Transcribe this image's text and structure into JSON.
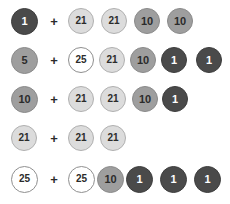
{
  "canvas": {
    "width": 230,
    "height": 204,
    "background": "#ffffff"
  },
  "legend": {
    "operator": "+",
    "token_colors": {
      "1": "#4a4a4a",
      "5": "#9e9e9e",
      "10": "#9e9e9e",
      "21": "#dcdcdc",
      "25": "#ffffff"
    },
    "border_colors": {
      "1": "#3d3d3d",
      "5": "#8a8a8a",
      "10": "#8a8a8a",
      "21": "#b0b0b0",
      "25": "#8f8f8f"
    },
    "text_colors": {
      "1": "#ffffff",
      "5": "#2b2b2b",
      "10": "#2b2b2b",
      "21": "#2b2b2b",
      "25": "#2b2b2b"
    }
  },
  "rows": [
    {
      "name": "row-1",
      "items": [
        {
          "kind": "token",
          "value": "1",
          "size": 27,
          "left": 11,
          "gap_after": 11
        },
        {
          "kind": "plus",
          "value": "+",
          "size": 10,
          "left": 49,
          "gap_after": 9
        },
        {
          "kind": "token",
          "value": "21",
          "size": 26,
          "left": 68,
          "gap_after": 7
        },
        {
          "kind": "token",
          "value": "21",
          "size": 26,
          "left": 101,
          "gap_after": 7
        },
        {
          "kind": "token",
          "value": "10",
          "size": 26,
          "left": 134,
          "gap_after": 7
        },
        {
          "kind": "token",
          "value": "10",
          "size": 26,
          "left": 167,
          "gap_after": 0
        }
      ]
    },
    {
      "name": "row-2",
      "items": [
        {
          "kind": "token",
          "value": "5",
          "size": 27,
          "left": 11,
          "gap_after": 11
        },
        {
          "kind": "plus",
          "value": "+",
          "size": 10,
          "left": 49,
          "gap_after": 9
        },
        {
          "kind": "token",
          "value": "25",
          "size": 26,
          "left": 68,
          "gap_after": 5
        },
        {
          "kind": "token",
          "value": "21",
          "size": 26,
          "left": 99,
          "gap_after": 5
        },
        {
          "kind": "token",
          "value": "10",
          "size": 26,
          "left": 130,
          "gap_after": 5
        },
        {
          "kind": "token",
          "value": "1",
          "size": 26,
          "left": 161,
          "gap_after": 5
        },
        {
          "kind": "token",
          "value": "1",
          "size": 26,
          "left": 196,
          "gap_after": 0
        }
      ]
    },
    {
      "name": "row-3",
      "items": [
        {
          "kind": "token",
          "value": "10",
          "size": 27,
          "left": 11,
          "gap_after": 11
        },
        {
          "kind": "plus",
          "value": "+",
          "size": 10,
          "left": 49,
          "gap_after": 9
        },
        {
          "kind": "token",
          "value": "21",
          "size": 26,
          "left": 68,
          "gap_after": 6
        },
        {
          "kind": "token",
          "value": "21",
          "size": 26,
          "left": 100,
          "gap_after": 6
        },
        {
          "kind": "token",
          "value": "10",
          "size": 26,
          "left": 132,
          "gap_after": 6
        },
        {
          "kind": "token",
          "value": "1",
          "size": 26,
          "left": 162,
          "gap_after": 0
        }
      ]
    },
    {
      "name": "row-4",
      "items": [
        {
          "kind": "token",
          "value": "21",
          "size": 26,
          "left": 11,
          "gap_after": 12
        },
        {
          "kind": "plus",
          "value": "+",
          "size": 10,
          "left": 49,
          "gap_after": 9
        },
        {
          "kind": "token",
          "value": "21",
          "size": 26,
          "left": 68,
          "gap_after": 6
        },
        {
          "kind": "token",
          "value": "21",
          "size": 26,
          "left": 100,
          "gap_after": 0
        }
      ]
    },
    {
      "name": "row-5",
      "items": [
        {
          "kind": "token",
          "value": "25",
          "size": 27,
          "left": 11,
          "gap_after": 11
        },
        {
          "kind": "plus",
          "value": "+",
          "size": 10,
          "left": 49,
          "gap_after": 9
        },
        {
          "kind": "token",
          "value": "25",
          "size": 27,
          "left": 68,
          "gap_after": 2
        },
        {
          "kind": "token",
          "value": "10",
          "size": 27,
          "left": 97,
          "gap_after": 2
        },
        {
          "kind": "token",
          "value": "1",
          "size": 27,
          "left": 126,
          "gap_after": 2
        },
        {
          "kind": "token",
          "value": "1",
          "size": 27,
          "left": 160,
          "gap_after": 2
        },
        {
          "kind": "token",
          "value": "1",
          "size": 27,
          "left": 194,
          "gap_after": 0
        }
      ]
    }
  ]
}
